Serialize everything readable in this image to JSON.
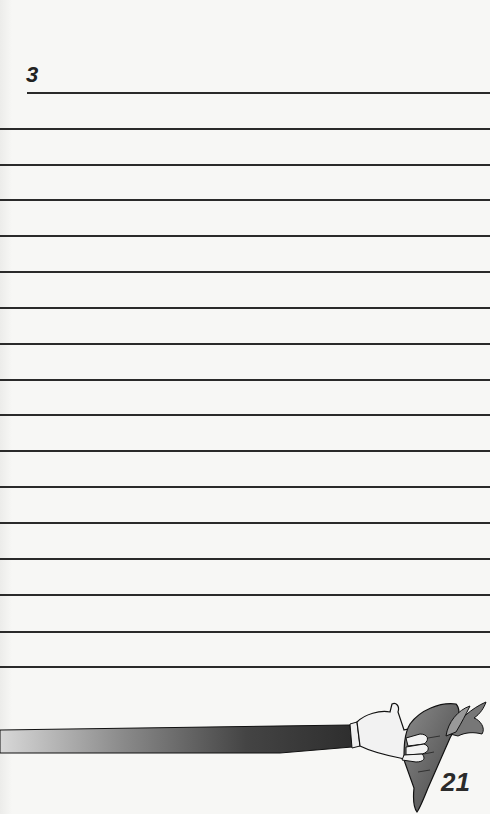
{
  "page": {
    "section_number": "3",
    "page_number": "21",
    "ruled_line_count": 17,
    "illustration": "hand-holding-carrot"
  },
  "colors": {
    "paper": "#f7f7f5",
    "ink": "#2a2a2a"
  }
}
